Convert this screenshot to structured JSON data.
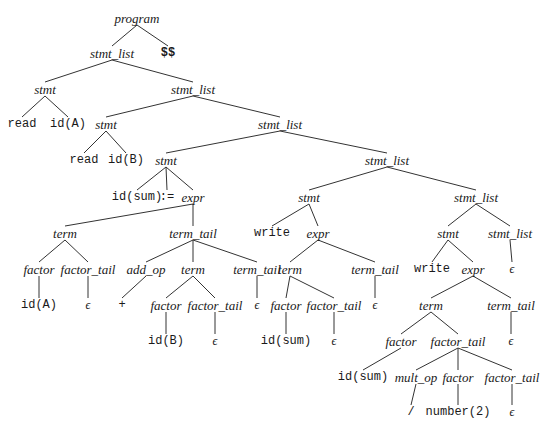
{
  "diagram": {
    "type": "parse-tree",
    "edge_color": "#333333",
    "nodes": [
      {
        "id": "n0",
        "label": "program",
        "kind": "nt",
        "x": 137,
        "y": 18
      },
      {
        "id": "n1",
        "label": "stmt_list",
        "kind": "nt",
        "x": 112,
        "y": 53
      },
      {
        "id": "n2",
        "label": "$$",
        "kind": "tok",
        "x": 168,
        "y": 53,
        "bold": true
      },
      {
        "id": "n3",
        "label": "stmt",
        "kind": "nt",
        "x": 45,
        "y": 89
      },
      {
        "id": "n4",
        "label": "stmt_list",
        "kind": "nt",
        "x": 193,
        "y": 89
      },
      {
        "id": "n5",
        "label": "read",
        "kind": "tok",
        "x": 22,
        "y": 124
      },
      {
        "id": "n6",
        "label": "id(A)",
        "kind": "tok",
        "x": 68,
        "y": 124
      },
      {
        "id": "n7",
        "label": "stmt",
        "kind": "nt",
        "x": 106,
        "y": 124
      },
      {
        "id": "n8",
        "label": "stmt_list",
        "kind": "nt",
        "x": 280,
        "y": 124
      },
      {
        "id": "n9",
        "label": "read",
        "kind": "tok",
        "x": 84,
        "y": 160
      },
      {
        "id": "n10",
        "label": "id(B)",
        "kind": "tok",
        "x": 126,
        "y": 160
      },
      {
        "id": "n11",
        "label": "stmt",
        "kind": "nt",
        "x": 166,
        "y": 160
      },
      {
        "id": "n12",
        "label": "stmt_list",
        "kind": "nt",
        "x": 387,
        "y": 160
      },
      {
        "id": "n13",
        "label": "id(sum)",
        "kind": "tok",
        "x": 137,
        "y": 197
      },
      {
        "id": "n14",
        "label": ":=",
        "kind": "tok",
        "x": 167,
        "y": 197
      },
      {
        "id": "n15",
        "label": "expr",
        "kind": "nt",
        "x": 193,
        "y": 197
      },
      {
        "id": "n16",
        "label": "stmt",
        "kind": "nt",
        "x": 309,
        "y": 197
      },
      {
        "id": "n17",
        "label": "stmt_list",
        "kind": "nt",
        "x": 476,
        "y": 197
      },
      {
        "id": "n18",
        "label": "term",
        "kind": "nt",
        "x": 65,
        "y": 233
      },
      {
        "id": "n19",
        "label": "term_tail",
        "kind": "nt",
        "x": 193,
        "y": 233
      },
      {
        "id": "n20",
        "label": "write",
        "kind": "tok",
        "x": 272,
        "y": 233
      },
      {
        "id": "n21",
        "label": "expr",
        "kind": "nt",
        "x": 318,
        "y": 233
      },
      {
        "id": "n22",
        "label": "stmt",
        "kind": "nt",
        "x": 448,
        "y": 233
      },
      {
        "id": "n23",
        "label": "stmt_list",
        "kind": "nt",
        "x": 510,
        "y": 233
      },
      {
        "id": "n24",
        "label": "factor",
        "kind": "nt",
        "x": 39,
        "y": 269
      },
      {
        "id": "n25",
        "label": "factor_tail",
        "kind": "nt",
        "x": 88,
        "y": 269
      },
      {
        "id": "n26",
        "label": "add_op",
        "kind": "nt",
        "x": 146,
        "y": 269
      },
      {
        "id": "n27",
        "label": "term",
        "kind": "nt",
        "x": 193,
        "y": 269
      },
      {
        "id": "n28",
        "label": "term_tail",
        "kind": "nt",
        "x": 257,
        "y": 269
      },
      {
        "id": "n29",
        "label": "term",
        "kind": "nt",
        "x": 290,
        "y": 269
      },
      {
        "id": "n30",
        "label": "term_tail",
        "kind": "nt",
        "x": 375,
        "y": 269
      },
      {
        "id": "n31",
        "label": "write",
        "kind": "tok",
        "x": 432,
        "y": 269
      },
      {
        "id": "n32",
        "label": "expr",
        "kind": "nt",
        "x": 473,
        "y": 269
      },
      {
        "id": "n33",
        "label": "ϵ",
        "kind": "eps",
        "x": 512,
        "y": 269
      },
      {
        "id": "n34",
        "label": "id(A)",
        "kind": "tok",
        "x": 39,
        "y": 305
      },
      {
        "id": "n35",
        "label": "ϵ",
        "kind": "eps",
        "x": 88,
        "y": 305
      },
      {
        "id": "n36",
        "label": "+",
        "kind": "tok",
        "x": 122,
        "y": 305
      },
      {
        "id": "n37",
        "label": "factor",
        "kind": "nt",
        "x": 166,
        "y": 305
      },
      {
        "id": "n38",
        "label": "factor_tail",
        "kind": "nt",
        "x": 215,
        "y": 305
      },
      {
        "id": "n39",
        "label": "ϵ",
        "kind": "eps",
        "x": 257,
        "y": 305
      },
      {
        "id": "n40",
        "label": "factor",
        "kind": "nt",
        "x": 286,
        "y": 305
      },
      {
        "id": "n41",
        "label": "factor_tail",
        "kind": "nt",
        "x": 334,
        "y": 305
      },
      {
        "id": "n42",
        "label": "ϵ",
        "kind": "eps",
        "x": 375,
        "y": 305
      },
      {
        "id": "n43",
        "label": "term",
        "kind": "nt",
        "x": 431,
        "y": 305
      },
      {
        "id": "n44",
        "label": "term_tail",
        "kind": "nt",
        "x": 511,
        "y": 305
      },
      {
        "id": "n45",
        "label": "id(B)",
        "kind": "tok",
        "x": 166,
        "y": 341
      },
      {
        "id": "n46",
        "label": "ϵ",
        "kind": "eps",
        "x": 215,
        "y": 341
      },
      {
        "id": "n47",
        "label": "id(sum)",
        "kind": "tok",
        "x": 286,
        "y": 341
      },
      {
        "id": "n48",
        "label": "ϵ",
        "kind": "eps",
        "x": 334,
        "y": 341
      },
      {
        "id": "n49",
        "label": "factor",
        "kind": "nt",
        "x": 401,
        "y": 341
      },
      {
        "id": "n50",
        "label": "factor_tail",
        "kind": "nt",
        "x": 458,
        "y": 341
      },
      {
        "id": "n51",
        "label": "ϵ",
        "kind": "eps",
        "x": 511,
        "y": 341
      },
      {
        "id": "n52",
        "label": "id(sum)",
        "kind": "tok",
        "x": 363,
        "y": 377
      },
      {
        "id": "n53",
        "label": "mult_op",
        "kind": "nt",
        "x": 416,
        "y": 377
      },
      {
        "id": "n54",
        "label": "factor",
        "kind": "nt",
        "x": 458,
        "y": 377
      },
      {
        "id": "n55",
        "label": "factor_tail",
        "kind": "nt",
        "x": 512,
        "y": 377
      },
      {
        "id": "n56",
        "label": "/",
        "kind": "tok",
        "x": 411,
        "y": 412
      },
      {
        "id": "n57",
        "label": "number(2)",
        "kind": "tok",
        "x": 458,
        "y": 412
      },
      {
        "id": "n58",
        "label": "ϵ",
        "kind": "eps",
        "x": 512,
        "y": 412
      }
    ],
    "edges": [
      [
        "n0",
        "n1"
      ],
      [
        "n0",
        "n2"
      ],
      [
        "n1",
        "n3"
      ],
      [
        "n1",
        "n4"
      ],
      [
        "n3",
        "n5"
      ],
      [
        "n3",
        "n6"
      ],
      [
        "n4",
        "n7"
      ],
      [
        "n4",
        "n8"
      ],
      [
        "n7",
        "n9"
      ],
      [
        "n7",
        "n10"
      ],
      [
        "n8",
        "n11"
      ],
      [
        "n8",
        "n12"
      ],
      [
        "n11",
        "n13"
      ],
      [
        "n11",
        "n14"
      ],
      [
        "n11",
        "n15"
      ],
      [
        "n12",
        "n16"
      ],
      [
        "n12",
        "n17"
      ],
      [
        "n15",
        "n18"
      ],
      [
        "n15",
        "n19"
      ],
      [
        "n16",
        "n20"
      ],
      [
        "n16",
        "n21"
      ],
      [
        "n17",
        "n22"
      ],
      [
        "n17",
        "n23"
      ],
      [
        "n18",
        "n24"
      ],
      [
        "n18",
        "n25"
      ],
      [
        "n19",
        "n26"
      ],
      [
        "n19",
        "n27"
      ],
      [
        "n19",
        "n28"
      ],
      [
        "n21",
        "n29"
      ],
      [
        "n21",
        "n30"
      ],
      [
        "n22",
        "n31"
      ],
      [
        "n22",
        "n32"
      ],
      [
        "n23",
        "n33"
      ],
      [
        "n24",
        "n34"
      ],
      [
        "n25",
        "n35"
      ],
      [
        "n26",
        "n36"
      ],
      [
        "n27",
        "n37"
      ],
      [
        "n27",
        "n38"
      ],
      [
        "n28",
        "n39"
      ],
      [
        "n29",
        "n40"
      ],
      [
        "n29",
        "n41"
      ],
      [
        "n30",
        "n42"
      ],
      [
        "n32",
        "n43"
      ],
      [
        "n32",
        "n44"
      ],
      [
        "n37",
        "n45"
      ],
      [
        "n38",
        "n46"
      ],
      [
        "n40",
        "n47"
      ],
      [
        "n41",
        "n48"
      ],
      [
        "n43",
        "n49"
      ],
      [
        "n43",
        "n50"
      ],
      [
        "n44",
        "n51"
      ],
      [
        "n49",
        "n52"
      ],
      [
        "n50",
        "n53"
      ],
      [
        "n50",
        "n54"
      ],
      [
        "n50",
        "n55"
      ],
      [
        "n53",
        "n56"
      ],
      [
        "n54",
        "n57"
      ],
      [
        "n55",
        "n58"
      ]
    ]
  }
}
